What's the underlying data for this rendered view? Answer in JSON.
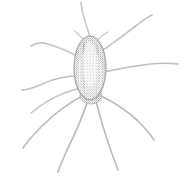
{
  "image": {
    "title": "Faded halftone illustration of a spider",
    "subject": "spider",
    "style": "dithered halftone line drawing, very light gray on white",
    "width": 185,
    "height": 178,
    "background_color": "#ffffff",
    "ink_color": "#b9b9b9",
    "ink_color_light": "#d8d8d8",
    "ink_color_dark": "#9a9a9a",
    "alt_text": "A very faint, grainy grayscale drawing of a long-legged spider with an elongated oval body seen from above and eight slender legs radiating outward."
  },
  "figure": {
    "body": {
      "label": "spider-body",
      "shape": "elongated oval (abdomen)",
      "center_x": 90,
      "center_y": 68,
      "width": 32,
      "height": 64,
      "top_y": 36,
      "bottom_y": 100,
      "fill_color": "#dcdcdc",
      "outline_color": "#a8a8a8"
    },
    "body_highlight": {
      "label": "body-inner-highlight",
      "center_x": 90,
      "center_y": 64,
      "width": 14,
      "height": 46,
      "fill_color": "#f2f2f2"
    },
    "cephalothorax": {
      "label": "spider-cephalothorax",
      "center_x": 91,
      "center_y": 96,
      "width": 22,
      "height": 16,
      "fill_color": "#cfcfcf"
    },
    "leg_origin": {
      "x": 90,
      "y": 92
    },
    "legs": [
      {
        "id": "leg-left-1",
        "side": "left",
        "index": 1,
        "description": "upper left leg curving up and out toward mid-left",
        "path": "M 80 58 C 70 52, 58 47, 48 44 C 42 42, 36 43, 31 46",
        "stroke_width": 1.6,
        "color": "#c4c4c4"
      },
      {
        "id": "leg-left-2",
        "side": "left",
        "index": 2,
        "description": "left leg angling down-left to left edge",
        "path": "M 79 76 C 66 76, 52 79, 40 85 C 33 88, 27 90, 22 90",
        "stroke_width": 1.6,
        "color": "#c0c0c0"
      },
      {
        "id": "leg-left-3",
        "side": "left",
        "index": 3,
        "description": "long lower-left leg reaching toward bottom-left corner",
        "path": "M 86 94 C 72 101, 56 112, 42 126 C 33 135, 27 142, 23 148",
        "stroke_width": 1.7,
        "color": "#bdbdbd"
      },
      {
        "id": "leg-left-4",
        "side": "left",
        "index": 4,
        "description": "lower leg descending to bottom of frame, slightly left of centre",
        "path": "M 89 97 C 84 113, 76 132, 67 150 C 63 159, 60 166, 58 172",
        "stroke_width": 1.7,
        "color": "#bababa"
      },
      {
        "id": "leg-right-1",
        "side": "right",
        "index": 1,
        "description": "near-vertical front leg rising to the top edge",
        "path": "M 92 44 C 89 34, 86 24, 83 14 C 82 9, 81 5, 81 2",
        "stroke_width": 1.5,
        "color": "#c6c6c6"
      },
      {
        "id": "leg-right-2",
        "side": "right",
        "index": 2,
        "description": "upper right leg angling to top-right corner",
        "path": "M 100 52 C 112 44, 125 34, 137 25 C 143 20, 148 17, 152 15",
        "stroke_width": 1.6,
        "color": "#c2c2c2"
      },
      {
        "id": "leg-right-3",
        "side": "right",
        "index": 3,
        "description": "right leg stretching to the right edge",
        "path": "M 104 72 C 118 69, 134 66, 150 64 C 160 63, 170 63, 178 64",
        "stroke_width": 1.6,
        "color": "#bfbfbf"
      },
      {
        "id": "leg-right-4",
        "side": "right",
        "index": 4,
        "description": "lower right leg sweeping down-right",
        "path": "M 99 95 C 112 101, 126 110, 138 121 C 145 128, 150 134, 154 140",
        "stroke_width": 1.7,
        "color": "#bcbcbc"
      },
      {
        "id": "leg-right-5",
        "side": "right",
        "index": 5,
        "description": "lower leg descending to the bottom-right of frame",
        "path": "M 95 97 C 99 113, 104 131, 110 148 C 113 157, 116 164, 118 170",
        "stroke_width": 1.6,
        "color": "#bababa"
      },
      {
        "id": "leg-left-5",
        "side": "left",
        "index": 5,
        "description": "short left leg just above the body joint",
        "path": "M 82 88 C 70 90, 58 95, 46 102 C 40 106, 35 110, 31 113",
        "stroke_width": 1.5,
        "color": "#c3c3c3"
      }
    ],
    "palps": [
      {
        "id": "palp-left",
        "description": "short left palp near the head",
        "path": "M 84 40 C 80 36, 77 33, 75 31",
        "stroke_width": 1.3,
        "color": "#c9c9c9"
      },
      {
        "id": "palp-right",
        "description": "short right palp near the head",
        "path": "M 97 40 C 101 36, 105 34, 108 32",
        "stroke_width": 1.3,
        "color": "#c9c9c9"
      }
    ]
  }
}
